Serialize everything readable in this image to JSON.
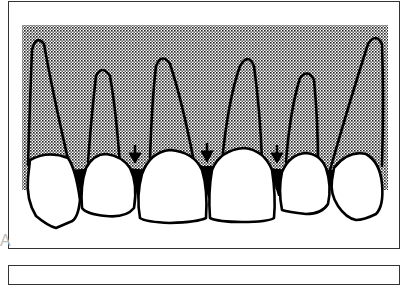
{
  "figure": {
    "panel_label": "A",
    "colors": {
      "frame": "#333333",
      "stipple_dot": "#222222",
      "background": "#ffffff",
      "outline": "#000000",
      "papilla_fill": "#000000"
    },
    "stipple_region": {
      "x": 22,
      "y": 25,
      "width": 366,
      "height": 165
    },
    "teeth": [
      {
        "name": "right-canine",
        "crown_center_x": 52,
        "root_apex": [
          38,
          38
        ]
      },
      {
        "name": "right-lateral-incisor",
        "crown_center_x": 108,
        "root_apex": [
          104,
          68
        ]
      },
      {
        "name": "right-central-incisor",
        "crown_center_x": 172,
        "root_apex": [
          162,
          58
        ]
      },
      {
        "name": "left-central-incisor",
        "crown_center_x": 244,
        "root_apex": [
          248,
          60
        ]
      },
      {
        "name": "left-lateral-incisor",
        "crown_center_x": 305,
        "root_apex": [
          307,
          72
        ]
      },
      {
        "name": "left-canine",
        "crown_center_x": 362,
        "root_apex": [
          377,
          36
        ]
      }
    ],
    "arrows": [
      {
        "name": "arrow-papilla-1",
        "x": 135,
        "y_top": 145,
        "y_tip": 163
      },
      {
        "name": "arrow-papilla-2",
        "x": 207,
        "y_top": 143,
        "y_tip": 162
      },
      {
        "name": "arrow-papilla-3",
        "x": 277,
        "y_top": 145,
        "y_tip": 163
      }
    ]
  }
}
